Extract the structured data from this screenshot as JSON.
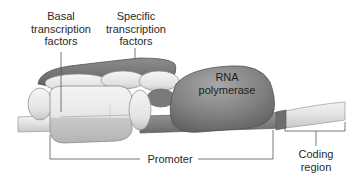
{
  "diagram": {
    "labels": {
      "basal": "Basal\ntranscription\nfactors",
      "specific": "Specific\ntranscription\nfactors",
      "rna_polymerase": "RNA\npolymerase",
      "promoter": "Promoter",
      "coding_region": "Coding\nregion"
    },
    "colors": {
      "dna_light": "#e4e4e4",
      "basal_factor_light": "#e9e9e9",
      "specific_factor_dark": "#7c7c7c",
      "rna_polymerase": "#858585",
      "leader_line": "#555555"
    }
  }
}
